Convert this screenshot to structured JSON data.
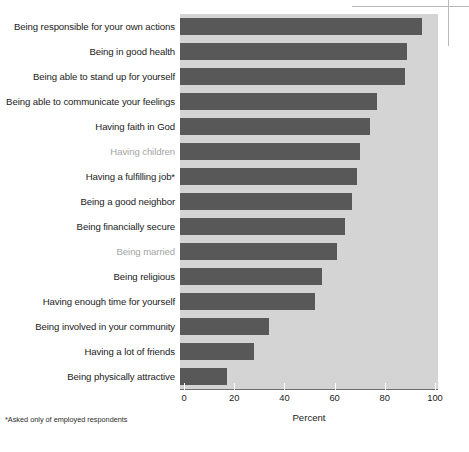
{
  "chart_data": {
    "type": "bar",
    "orientation": "horizontal",
    "title": "",
    "xlabel": "Percent",
    "ylabel": "",
    "xlim": [
      0,
      100
    ],
    "xticks": [
      0,
      20,
      40,
      60,
      80,
      100
    ],
    "grid": false,
    "legend": false,
    "bar_color": "#585858",
    "panel_color": "#d4d4d4",
    "muted_label_color": "#a5a5a5",
    "categories": [
      "Being responsible for your own actions",
      "Being in good health",
      "Being able to stand up for yourself",
      "Being able to communicate your feelings",
      "Having faith in God",
      "Having children",
      "Having a fulfilling job*",
      "Being a good neighbor",
      "Being financially secure",
      "Being married",
      "Being religious",
      "Having enough time for yourself",
      "Being involved in your community",
      "Having a lot of friends",
      "Being physically attractive"
    ],
    "values": [
      95,
      89,
      88,
      77,
      74,
      70,
      69,
      67,
      64,
      61,
      55,
      52,
      34,
      28,
      17
    ],
    "muted_categories": [
      "Having children",
      "Being married"
    ],
    "footnote": "*Asked only of employed respondents"
  },
  "axis": {
    "x_title": "Percent",
    "tick_labels": [
      "0",
      "20",
      "40",
      "60",
      "80",
      "100"
    ]
  },
  "footnote": {
    "text": "*Asked only of employed respondents"
  }
}
